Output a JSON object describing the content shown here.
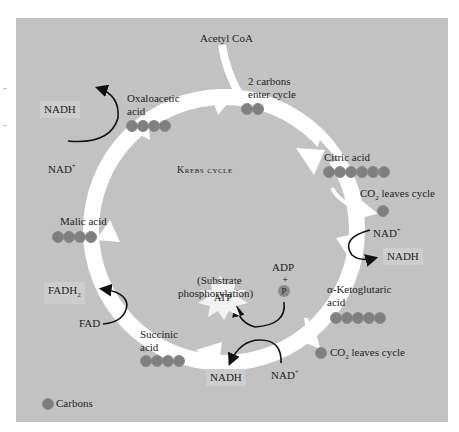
{
  "diagram": {
    "title": "Krebs cycle",
    "center_label": "Krebs cycle",
    "colors": {
      "background": "#c2c2c2",
      "arrow": "#ffffff",
      "carbon_dot": "#7f7f7f",
      "text": "#222222",
      "label_box": "#cdcdcd"
    },
    "inputs": {
      "acetyl_coa": "Acetyl CoA",
      "entry_note_line1": "2 carbons",
      "entry_note_line2": "enter cycle",
      "entry_carbons": 2
    },
    "intermediates": [
      {
        "name_line1": "Citric acid",
        "name_line2": "",
        "carbons": 6
      },
      {
        "name_line1": "α-Ketoglutaric",
        "name_line2": "acid",
        "carbons": 5
      },
      {
        "name_line1": "Succinic",
        "name_line2": "acid",
        "carbons": 4
      },
      {
        "name_line1": "Malic acid",
        "name_line2": "",
        "carbons": 4
      },
      {
        "name_line1": "Oxaloacetic",
        "name_line2": "acid",
        "carbons": 4
      }
    ],
    "co2_outputs": [
      {
        "label": "CO",
        "sub": "2",
        "suffix": " leaves cycle"
      },
      {
        "label": "CO",
        "sub": "2",
        "suffix": " leaves cycle"
      }
    ],
    "cofactors": {
      "nad_right_in": "NAD",
      "nad_right_in_sup": "+",
      "nadh_right_out": "NADH",
      "nad_bottom_in": "NAD",
      "nad_bottom_in_sup": "+",
      "nadh_bottom_out": "NADH",
      "nad_left_in": "NAD",
      "nad_left_in_sup": "+",
      "nadh_left_out": "NADH",
      "fad_in": "FAD",
      "fadh2_out": "FADH",
      "fadh2_sub": "2"
    },
    "atp": {
      "label": "ATP",
      "adp": "ADP",
      "plus": "+",
      "phosphate": "P",
      "note_line1": "(Substrate",
      "note_line2": "phosphorylation)"
    },
    "legend": {
      "label": "Carbons"
    }
  }
}
